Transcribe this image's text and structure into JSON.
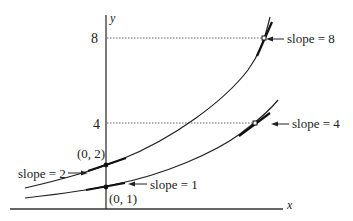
{
  "diagram": {
    "type": "exponential-curves-with-tangent-slopes",
    "axes": {
      "x_label": "x",
      "y_label": "y"
    },
    "y_ticks": [
      {
        "label": "8",
        "value": 8
      },
      {
        "label": "4",
        "value": 4
      }
    ],
    "curves": [
      {
        "name": "upper-curve",
        "y_intercept_label": "(0, 2)",
        "intercept_slope_label": "slope = 2",
        "marked_point_value": 8,
        "marked_slope_label": "slope = 8"
      },
      {
        "name": "lower-curve",
        "y_intercept_label": "(0, 1)",
        "intercept_slope_label": "slope = 1",
        "marked_point_value": 4,
        "marked_slope_label": "slope = 4"
      }
    ],
    "colors": {
      "ink": "#222222",
      "background": "#ffffff"
    }
  }
}
